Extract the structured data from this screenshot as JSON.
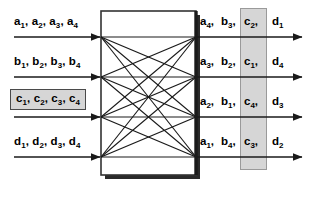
{
  "figure": {
    "type": "crossbar-switch-diagram",
    "title": "",
    "background_color": "#ffffff",
    "line_color": "#1a1a1a",
    "highlight_fill": "#d6d6d6",
    "highlight_border": "#9a9a9a",
    "box_border": "#333333"
  },
  "inputs": [
    {
      "id": "in-a",
      "text": "a₁, a₂, a₃, a₄",
      "parts": [
        {
          "base": "a",
          "sub": "1"
        },
        {
          "base": "a",
          "sub": "2"
        },
        {
          "base": "a",
          "sub": "3"
        },
        {
          "base": "a",
          "sub": "4"
        }
      ],
      "highlighted": false
    },
    {
      "id": "in-b",
      "text": "b₁, b₂, b₃, b₄",
      "parts": [
        {
          "base": "b",
          "sub": "1"
        },
        {
          "base": "b",
          "sub": "2"
        },
        {
          "base": "b",
          "sub": "3"
        },
        {
          "base": "b",
          "sub": "4"
        }
      ],
      "highlighted": false
    },
    {
      "id": "in-c",
      "text": "c₁, c₂, c₃, c₄",
      "parts": [
        {
          "base": "c",
          "sub": "1"
        },
        {
          "base": "c",
          "sub": "2"
        },
        {
          "base": "c",
          "sub": "3"
        },
        {
          "base": "c",
          "sub": "4"
        }
      ],
      "highlighted": true
    },
    {
      "id": "in-d",
      "text": "d₁, d₂, d₃, d₄",
      "parts": [
        {
          "base": "d",
          "sub": "1"
        },
        {
          "base": "d",
          "sub": "2"
        },
        {
          "base": "d",
          "sub": "3"
        },
        {
          "base": "d",
          "sub": "4"
        }
      ],
      "highlighted": false
    }
  ],
  "outputs": [
    {
      "id": "out-row-1",
      "cells": [
        {
          "base": "a",
          "sub": "4",
          "trail": ",",
          "highlighted": false
        },
        {
          "base": "b",
          "sub": "3",
          "trail": ",",
          "highlighted": false
        },
        {
          "base": "c",
          "sub": "2",
          "trail": ",",
          "highlighted": true
        },
        {
          "base": "d",
          "sub": "1",
          "trail": "",
          "highlighted": false
        }
      ]
    },
    {
      "id": "out-row-2",
      "cells": [
        {
          "base": "a",
          "sub": "3",
          "trail": ",",
          "highlighted": false
        },
        {
          "base": "b",
          "sub": "2",
          "trail": ",",
          "highlighted": false
        },
        {
          "base": "c",
          "sub": "1",
          "trail": ",",
          "highlighted": true
        },
        {
          "base": "d",
          "sub": "4",
          "trail": "",
          "highlighted": false
        }
      ]
    },
    {
      "id": "out-row-3",
      "cells": [
        {
          "base": "a",
          "sub": "2",
          "trail": ",",
          "highlighted": false
        },
        {
          "base": "b",
          "sub": "1",
          "trail": ",",
          "highlighted": false
        },
        {
          "base": "c",
          "sub": "4",
          "trail": ",",
          "highlighted": true
        },
        {
          "base": "d",
          "sub": "3",
          "trail": "",
          "highlighted": false
        }
      ]
    },
    {
      "id": "out-row-4",
      "cells": [
        {
          "base": "a",
          "sub": "1",
          "trail": ",",
          "highlighted": false
        },
        {
          "base": "b",
          "sub": "4",
          "trail": ",",
          "highlighted": false
        },
        {
          "base": "c",
          "sub": "3",
          "trail": ",",
          "highlighted": true
        },
        {
          "base": "d",
          "sub": "2",
          "trail": "",
          "highlighted": false
        }
      ]
    }
  ],
  "switch": {
    "label": "",
    "input_nodes": 4,
    "output_nodes": 4,
    "connections": "full-mesh-16"
  },
  "geometry": {
    "row_y": [
      37,
      77,
      117,
      157
    ],
    "box": {
      "x": 101,
      "y": 11,
      "w": 95,
      "h": 164
    },
    "arrow_start_x": 14,
    "arrow_end_x": 302,
    "band": {
      "x": 240,
      "y": 8,
      "w": 27,
      "h": 162
    }
  }
}
